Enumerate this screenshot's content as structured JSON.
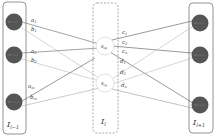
{
  "diagram": {
    "left_layer": {
      "label": "I",
      "label_sub": "l−1",
      "nodes": [
        {
          "label": "v",
          "sub": "l−1,1"
        },
        {
          "label": "v",
          "sub": "l−1,2"
        },
        {
          "label": "v",
          "sub": "l−1,m"
        }
      ]
    },
    "middle_layer": {
      "label": "I",
      "label_sub": "l",
      "nodes": [
        {
          "label": "s",
          "sub": "ip"
        },
        {
          "label": "s",
          "sub": "iq"
        }
      ]
    },
    "right_layer": {
      "label": "I",
      "label_sub": "l+1",
      "nodes": [
        {
          "label": "v",
          "sub": "l+1,1"
        },
        {
          "label": "v",
          "sub": "l+1,2"
        },
        {
          "label": "v",
          "sub": "l+1,n"
        }
      ]
    },
    "edge_labels_left": [
      {
        "t": "a",
        "s": "1"
      },
      {
        "t": "b",
        "s": "1"
      },
      {
        "t": "a",
        "s": "2"
      },
      {
        "t": "b",
        "s": "2"
      },
      {
        "t": "a",
        "s": "m"
      },
      {
        "t": "b",
        "s": "m"
      }
    ],
    "edge_labels_right": [
      {
        "t": "c",
        "s": "1"
      },
      {
        "t": "c",
        "s": "2"
      },
      {
        "t": "c",
        "s": "n"
      },
      {
        "t": "d",
        "s": "1"
      },
      {
        "t": "d",
        "s": "2"
      },
      {
        "t": "d",
        "s": "n"
      }
    ],
    "colors": {
      "node_fill": "#555555",
      "box_stroke": "#777777",
      "dark_edge": "#555555",
      "light_edge": "#aaaaaa"
    }
  }
}
